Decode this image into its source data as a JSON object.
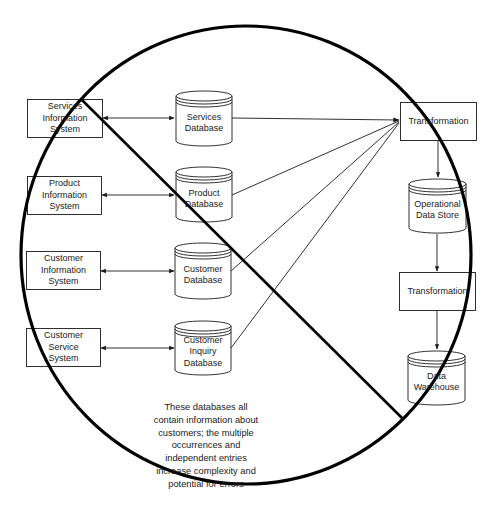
{
  "diagram": {
    "type": "data-flow / anti-pattern (crossed out)",
    "source_systems": [
      {
        "id": "svc-sys",
        "label": "Services\nInformation\nSystem"
      },
      {
        "id": "prod-sys",
        "label": "Product\nInformation\nSystem"
      },
      {
        "id": "cust-sys",
        "label": "Customer\nInformation\nSystem"
      },
      {
        "id": "csvc-sys",
        "label": "Customer\nService\nSystem"
      }
    ],
    "databases": [
      {
        "id": "svc-db",
        "label": "Services\nDatabase"
      },
      {
        "id": "prod-db",
        "label": "Product\nDatabase"
      },
      {
        "id": "cust-db",
        "label": "Customer\nDatabase"
      },
      {
        "id": "inq-db",
        "label": "Customer\nInquiry\nDatabase"
      }
    ],
    "pipeline": [
      {
        "id": "transform-1",
        "kind": "process",
        "label": "Transformation"
      },
      {
        "id": "ods",
        "kind": "store",
        "label": "Operational\nData Store"
      },
      {
        "id": "transform-2",
        "kind": "process",
        "label": "Transformation"
      },
      {
        "id": "dw",
        "kind": "store",
        "label": "Data\nWarehouse"
      }
    ],
    "edges": [
      {
        "from": "svc-sys",
        "to": "svc-db",
        "style": "bidirectional"
      },
      {
        "from": "prod-sys",
        "to": "prod-db",
        "style": "bidirectional"
      },
      {
        "from": "cust-sys",
        "to": "cust-db",
        "style": "bidirectional"
      },
      {
        "from": "csvc-sys",
        "to": "inq-db",
        "style": "bidirectional"
      },
      {
        "from": "svc-db",
        "to": "transform-1",
        "style": "directed"
      },
      {
        "from": "prod-db",
        "to": "transform-1",
        "style": "directed"
      },
      {
        "from": "cust-db",
        "to": "transform-1",
        "style": "directed"
      },
      {
        "from": "inq-db",
        "to": "transform-1",
        "style": "directed"
      },
      {
        "from": "transform-1",
        "to": "ods",
        "style": "directed"
      },
      {
        "from": "ods",
        "to": "transform-2",
        "style": "directed"
      },
      {
        "from": "transform-2",
        "to": "dw",
        "style": "directed"
      }
    ],
    "note": "These databases all\ncontain information about\ncustomers; the multiple\noccurrences and\nindependent entries\nincrease complexity and\npotential for errors",
    "overlay": "prohibition-sign",
    "colors": {
      "stroke": "#1a1a1a",
      "background": "#ffffff",
      "overlay": "#000000"
    }
  }
}
